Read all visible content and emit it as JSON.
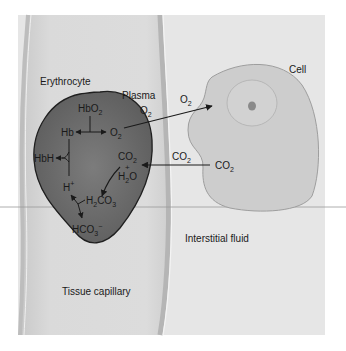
{
  "diagram": {
    "type": "gas-exchange-tissue",
    "regions": {
      "erythrocyte": "Erythrocyte",
      "plasma": "Plasma",
      "cell": "Cell",
      "interstitial_fluid": "Interstitial fluid",
      "tissue_capillary": "Tissue capillary"
    },
    "erythrocyte_species": {
      "hbo2": {
        "base": "HbO",
        "sub": "2"
      },
      "hb": "Hb",
      "o2_inner": {
        "base": "O",
        "sub": "2"
      },
      "hbh": "HbH",
      "h_plus": {
        "base": "H",
        "sup": "+"
      },
      "co2_inner": {
        "base": "CO",
        "sub": "2"
      },
      "plus": "+",
      "h2o": {
        "pre": "H",
        "sub": "2",
        "post": "O"
      },
      "h2co3": {
        "pre": "H",
        "sub1": "2",
        "mid": "CO",
        "sub2": "3"
      },
      "hco3": {
        "base": "HCO",
        "sub": "3",
        "sup": "−"
      }
    },
    "plasma_species": {
      "o2": {
        "base": "O",
        "sub": "2"
      }
    },
    "interstitial_species": {
      "o2": {
        "base": "O",
        "sub": "2"
      },
      "co2": {
        "base": "CO",
        "sub": "2"
      }
    },
    "cell_species": {
      "co2": {
        "base": "CO",
        "sub": "2"
      }
    },
    "colors": {
      "panel": "#e4e4e4",
      "capillary": "#d6d6d6",
      "erythrocyte": "#6e6e6e",
      "cell": "#cfcfcf",
      "nucleus_ring": "#b8b8b8",
      "nucleolus": "#8a8a8a",
      "outline": "#2a2a2a",
      "text": "#1a1a1a"
    },
    "arrows": [
      {
        "from": "O2 (erythrocyte)",
        "to": "Cell",
        "label": "O2"
      },
      {
        "from": "CO2 (cell)",
        "to": "Erythrocyte",
        "label": "CO2"
      },
      {
        "from": "HbO2",
        "to": [
          "Hb",
          "O2"
        ]
      },
      {
        "from": "Hb + H+",
        "to": "HbH"
      },
      {
        "from": "CO2 + H2O",
        "to": "H2CO3"
      },
      {
        "from": "H2CO3",
        "to": [
          "H+",
          "HCO3-"
        ]
      }
    ]
  }
}
